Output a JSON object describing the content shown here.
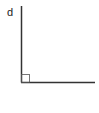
{
  "diagram": {
    "type": "right-angle",
    "label": "d",
    "colors": {
      "line": "#333333",
      "marker": "#555555",
      "label": "#222222",
      "background": "#ffffff"
    },
    "geometry": {
      "vertex": [
        21,
        82
      ],
      "vertical_end": [
        21,
        6
      ],
      "horizontal_end": [
        95,
        82
      ],
      "right_angle_marker_size": 8
    }
  }
}
